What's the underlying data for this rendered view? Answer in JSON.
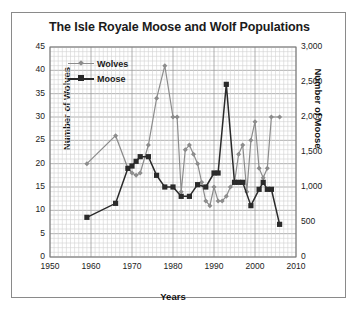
{
  "chart_data": {
    "type": "line",
    "title": "The Isle Royale Moose and Wolf Populations",
    "xlabel": "Years",
    "ylabel": "Number of Wolves",
    "ylabel_right": "Number of Moose",
    "xlim": [
      1950,
      2010
    ],
    "ylim": [
      0,
      45
    ],
    "ylim_right": [
      0,
      3000
    ],
    "xticks": [
      "1950",
      "1960",
      "1970",
      "1980",
      "1990",
      "2000",
      "2010"
    ],
    "yticks_left": [
      "0",
      "5",
      "10",
      "15",
      "20",
      "25",
      "30",
      "35",
      "40",
      "45"
    ],
    "yticks_right": [
      "0",
      "500",
      "1,000",
      "1,500",
      "2,000",
      "2,500",
      "3,000"
    ],
    "grid": true,
    "legend_position": "top-left",
    "colors": {
      "wolves": "#8c8c8c",
      "moose": "#2a2a2a",
      "grid": "#c9c9c9",
      "frame": "#8a8a8a"
    },
    "series": [
      {
        "name": "Wolves",
        "axis": "left",
        "marker": "diamond",
        "color": "#8c8c8c",
        "x": [
          1959,
          1966,
          1969,
          1970,
          1971,
          1972,
          1974,
          1976,
          1978,
          1980,
          1981,
          1982,
          1983,
          1984,
          1985,
          1986,
          1987,
          1988,
          1989,
          1990,
          1991,
          1992,
          1993,
          1994,
          1995,
          1996,
          1997,
          1998,
          1999,
          2000,
          2001,
          2002,
          2003,
          2004,
          2006
        ],
        "values": [
          20,
          26,
          19,
          18,
          17.5,
          18,
          24,
          34,
          41,
          30,
          30,
          14,
          23,
          24,
          22,
          20,
          16,
          12,
          11,
          15,
          12,
          12,
          13,
          15,
          16,
          22,
          24,
          14,
          25,
          29,
          19,
          17,
          19,
          30,
          30
        ]
      },
      {
        "name": "Moose",
        "axis": "right",
        "marker": "square",
        "color": "#2a2a2a",
        "x": [
          1959,
          1966,
          1969,
          1970,
          1971,
          1972,
          1974,
          1976,
          1978,
          1980,
          1982,
          1984,
          1986,
          1988,
          1990,
          1991,
          1993,
          1995,
          1996,
          1997,
          1999,
          2001,
          2002,
          2003,
          2004,
          2006
        ],
        "values_left_scale": [
          8.5,
          11.5,
          19,
          19.5,
          20.5,
          21.5,
          21.5,
          17.5,
          15,
          15,
          13,
          13,
          15.5,
          15,
          18,
          18,
          37,
          16,
          16,
          16,
          11,
          14.5,
          16,
          14.5,
          14.5,
          7
        ],
        "values": [
          567,
          767,
          1267,
          1300,
          1367,
          1433,
          1433,
          1167,
          1000,
          1000,
          867,
          867,
          1033,
          1000,
          1200,
          1200,
          2467,
          1067,
          1067,
          1067,
          733,
          967,
          1067,
          967,
          967,
          467
        ]
      }
    ]
  }
}
